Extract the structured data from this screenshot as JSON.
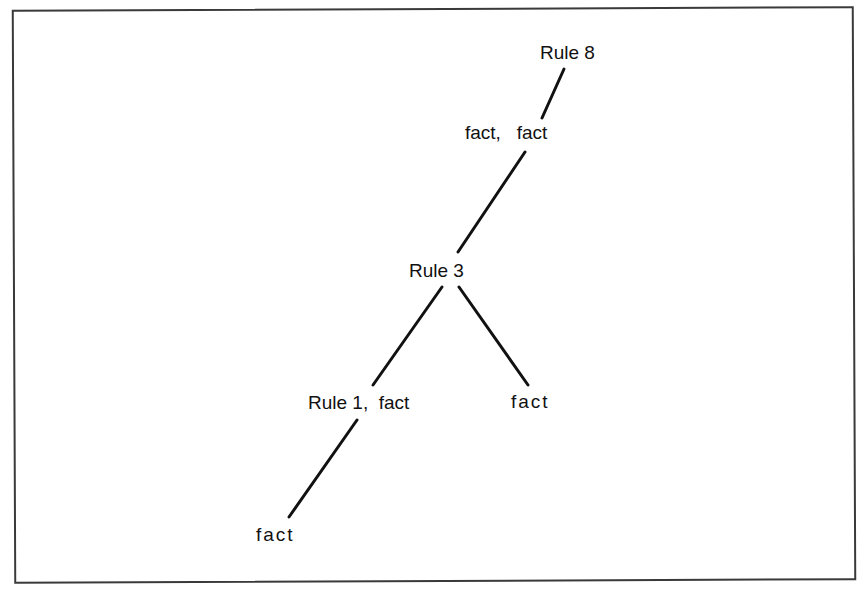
{
  "diagram": {
    "type": "proof-tree",
    "nodes": [
      {
        "id": "n_rule8",
        "label": "Rule 8"
      },
      {
        "id": "n_fact_fact",
        "label": "fact,   fact"
      },
      {
        "id": "n_rule3",
        "label": "Rule 3"
      },
      {
        "id": "n_rule1_fact",
        "label": "Rule 1,  fact"
      },
      {
        "id": "n_fact_right",
        "label": "fact"
      },
      {
        "id": "n_fact_bottom",
        "label": "fact"
      }
    ],
    "edges": [
      {
        "from": "n_rule8",
        "to": "n_fact_fact"
      },
      {
        "from": "n_fact_fact",
        "to": "n_rule3"
      },
      {
        "from": "n_rule3",
        "to": "n_rule1_fact"
      },
      {
        "from": "n_rule3",
        "to": "n_fact_right"
      },
      {
        "from": "n_rule1_fact",
        "to": "n_fact_bottom"
      }
    ],
    "line_color": "#111111"
  }
}
